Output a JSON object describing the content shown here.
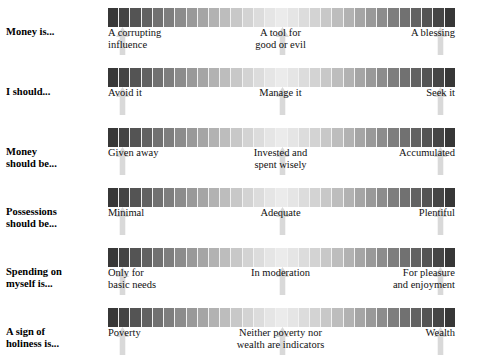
{
  "chart_data": {
    "type": "table",
    "title": "",
    "scale": {
      "segments": 31,
      "gradient_description": "dark gray at both ends, lightest at center",
      "dark_hex": "#2f2f2f",
      "mid_hex": "#ebebeb",
      "divider_hex": "#f2f2f2"
    },
    "anchor_positions": [
      "left",
      "center",
      "right"
    ],
    "marker_icon": "up-arrow-icon",
    "marker_hex": "#d9d9d9",
    "rows": [
      {
        "stem_line1": "Money is...",
        "stem_line2": "",
        "anchors": [
          "A corrupting\ninfluence",
          "A tool for\ngood or evil",
          "A blessing"
        ]
      },
      {
        "stem_line1": "I should...",
        "stem_line2": "",
        "anchors": [
          "Avoid it",
          "Manage it",
          "Seek it"
        ]
      },
      {
        "stem_line1": "Money",
        "stem_line2": "should be...",
        "anchors": [
          "Given away",
          "Invested and\nspent wisely",
          "Accumulated"
        ]
      },
      {
        "stem_line1": "Possessions",
        "stem_line2": "should be...",
        "anchors": [
          "Minimal",
          "Adequate",
          "Plentiful"
        ]
      },
      {
        "stem_line1": "Spending on",
        "stem_line2": "myself is...",
        "anchors": [
          "Only for\nbasic needs",
          "In moderation",
          "For pleasure\nand enjoyment"
        ]
      },
      {
        "stem_line1": "A sign of",
        "stem_line2": "holiness is...",
        "anchors": [
          "Poverty",
          "Neither poverty nor\nwealth are indicators",
          "Wealth"
        ]
      }
    ]
  }
}
